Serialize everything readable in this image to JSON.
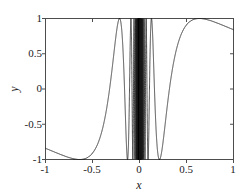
{
  "chart_data": {
    "type": "line",
    "title": "",
    "xlabel": "x",
    "ylabel": "y",
    "xlim": [
      -1,
      1
    ],
    "ylim": [
      -1,
      1
    ],
    "xticks": [
      -1,
      -0.5,
      0,
      0.5,
      1
    ],
    "xtick_labels": [
      "-1",
      "-0.5",
      "0",
      "0.5",
      "1"
    ],
    "yticks": [
      -1,
      -0.5,
      0,
      0.5,
      1
    ],
    "ytick_labels": [
      "-1",
      "-0.5",
      "0",
      "0.5",
      "1"
    ],
    "grid": false,
    "legend": null,
    "series": [
      {
        "name": "sin(1/x)",
        "expression": "sin(1/x)",
        "color": "#1a1a1a",
        "linewidth": 0.8,
        "points": [
          [
            -1.0,
            -0.8415
          ],
          [
            -0.98,
            -0.8468
          ],
          [
            -0.96,
            -0.8522
          ],
          [
            -0.94,
            -0.8576
          ],
          [
            -0.92,
            -0.8631
          ],
          [
            -0.9,
            -0.8687
          ],
          [
            -0.88,
            -0.8743
          ],
          [
            -0.86,
            -0.8799
          ],
          [
            -0.84,
            -0.8856
          ],
          [
            -0.82,
            -0.8913
          ],
          [
            -0.8,
            -0.897
          ],
          [
            -0.78,
            -0.9027
          ],
          [
            -0.76,
            -0.9084
          ],
          [
            -0.74,
            -0.914
          ],
          [
            -0.72,
            -0.9196
          ],
          [
            -0.7,
            -0.925
          ],
          [
            -0.68,
            -0.9303
          ],
          [
            -0.66,
            -0.9354
          ],
          [
            -0.64,
            -0.9403
          ],
          [
            -0.62,
            -0.9449
          ],
          [
            -0.6,
            -0.949
          ],
          [
            -0.58,
            -0.9527
          ],
          [
            -0.56,
            -0.9558
          ],
          [
            -0.54,
            -0.9582
          ],
          [
            -0.52,
            -0.9598
          ],
          [
            -0.5,
            -0.9093
          ],
          [
            -0.48,
            -0.9542
          ],
          [
            -0.46,
            -0.9321
          ],
          [
            -0.44,
            -0.8972
          ],
          [
            -0.42,
            -0.8452
          ],
          [
            -0.4,
            -0.7568
          ],
          [
            -0.38,
            -0.6691
          ],
          [
            -0.36,
            -0.5405
          ],
          [
            -0.34,
            -0.3668
          ],
          [
            -0.32,
            -0.1534
          ],
          [
            -0.3,
            0.1905
          ],
          [
            -0.28,
            0.5029
          ],
          [
            -0.26,
            0.8011
          ],
          [
            -0.24,
            0.9854
          ],
          [
            -0.22,
            0.9535
          ],
          [
            -0.2,
            0.6784
          ],
          [
            -0.18,
            0.0654
          ],
          [
            -0.16,
            -0.7246
          ],
          [
            -0.14,
            -0.9999
          ],
          [
            -0.12,
            -0.2879
          ],
          [
            -0.1,
            0.544
          ],
          [
            -0.09,
            0.9964
          ],
          [
            -0.08,
            -0.7451
          ],
          [
            -0.07,
            -0.2806
          ],
          [
            -0.06,
            0.9511
          ],
          [
            -0.05,
            0.9129
          ],
          [
            -0.04,
            -0.1324
          ],
          [
            -0.03,
            -0.9992
          ],
          [
            -0.02,
            -0.2624
          ],
          [
            -0.01,
            0.5064
          ],
          [
            0.0,
            0.0
          ],
          [
            0.01,
            -0.5064
          ],
          [
            0.02,
            0.2624
          ],
          [
            0.03,
            0.9992
          ],
          [
            0.04,
            0.1324
          ],
          [
            0.05,
            -0.9129
          ],
          [
            0.06,
            -0.9511
          ],
          [
            0.07,
            0.2806
          ],
          [
            0.08,
            0.7451
          ],
          [
            0.09,
            -0.9964
          ],
          [
            0.1,
            -0.544
          ],
          [
            0.12,
            0.2879
          ],
          [
            0.14,
            0.9999
          ],
          [
            0.16,
            0.7246
          ],
          [
            0.18,
            -0.0654
          ],
          [
            0.2,
            -0.6784
          ],
          [
            0.22,
            -0.9535
          ],
          [
            0.24,
            -0.9854
          ],
          [
            0.26,
            -0.8011
          ],
          [
            0.28,
            -0.5029
          ],
          [
            0.3,
            -0.1905
          ],
          [
            0.32,
            0.1534
          ],
          [
            0.34,
            0.3668
          ],
          [
            0.36,
            0.5405
          ],
          [
            0.38,
            0.6691
          ],
          [
            0.4,
            0.7568
          ],
          [
            0.42,
            0.8452
          ],
          [
            0.44,
            0.8972
          ],
          [
            0.46,
            0.9321
          ],
          [
            0.48,
            0.9542
          ],
          [
            0.5,
            0.9093
          ],
          [
            0.52,
            0.9598
          ],
          [
            0.54,
            0.9582
          ],
          [
            0.56,
            0.9558
          ],
          [
            0.58,
            0.9527
          ],
          [
            0.6,
            0.949
          ],
          [
            0.62,
            0.9449
          ],
          [
            0.64,
            0.9403
          ],
          [
            0.66,
            0.9354
          ],
          [
            0.68,
            0.9303
          ],
          [
            0.7,
            0.925
          ],
          [
            0.72,
            0.9196
          ],
          [
            0.74,
            0.914
          ],
          [
            0.76,
            0.9084
          ],
          [
            0.78,
            0.9027
          ],
          [
            0.8,
            0.897
          ],
          [
            0.82,
            0.8913
          ],
          [
            0.84,
            0.8856
          ],
          [
            0.86,
            0.8799
          ],
          [
            0.88,
            0.8743
          ],
          [
            0.9,
            0.8687
          ],
          [
            0.92,
            0.8631
          ],
          [
            0.94,
            0.8576
          ],
          [
            0.96,
            0.8522
          ],
          [
            0.98,
            0.8468
          ],
          [
            1.0,
            0.8415
          ]
        ]
      }
    ],
    "annotations": []
  },
  "axes": {
    "frame_color": "#4d4d4d",
    "line_color": "#1a1a1a",
    "background": "#ffffff"
  }
}
